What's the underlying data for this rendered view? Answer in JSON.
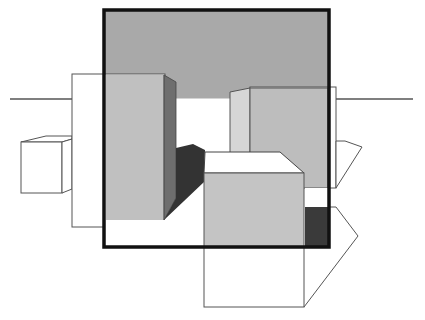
{
  "figure": {
    "colors": {
      "background": "#ffffff",
      "frame": "#111111",
      "sky_gray": "#a9a9a9",
      "light_gray": "#c2c2c2",
      "lighter_gray": "#d6d6d6",
      "mid_gray": "#8a8a8a",
      "dark_gray": "#3a3a3a",
      "outline": "#555555"
    },
    "shapes": [
      "window-frame",
      "horizon-line",
      "left-tall-box",
      "left-small-cube",
      "right-back-box",
      "front-cube",
      "shadow"
    ]
  }
}
